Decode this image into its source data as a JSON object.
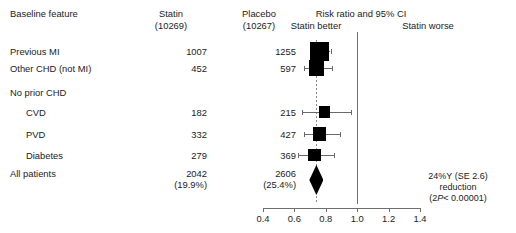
{
  "header": {
    "feature_label": "Baseline feature",
    "statin_label": "Statin",
    "statin_n": "(10269)",
    "placebo_label": "Placebo",
    "placebo_n": "(10267)",
    "plot_title": "Risk ratio and 95% CI",
    "left_side_label": "Statin better",
    "right_side_label": "Statin worse"
  },
  "rows": [
    {
      "feature": "Previous MI",
      "indent": false,
      "statin": "1007",
      "placebo": "1255"
    },
    {
      "feature": "Other CHD (not MI)",
      "indent": false,
      "statin": "452",
      "placebo": "597"
    },
    {
      "feature": "No prior CHD",
      "indent": false,
      "statin": "",
      "placebo": ""
    },
    {
      "feature": "CVD",
      "indent": true,
      "statin": "182",
      "placebo": "215"
    },
    {
      "feature": "PVD",
      "indent": true,
      "statin": "332",
      "placebo": "427"
    },
    {
      "feature": "Diabetes",
      "indent": true,
      "statin": "279",
      "placebo": "369"
    },
    {
      "feature": "All patients",
      "indent": false,
      "statin": "2042",
      "placebo": "2606"
    },
    {
      "feature": "",
      "indent": false,
      "statin": "(19.9%)",
      "placebo": "(25.4%)"
    }
  ],
  "summary_annotation": {
    "line1": "24%Y (SE 2.6)",
    "line2": "reduction",
    "line3_pre": "(2",
    "line3_italic": "P",
    "line3_post": "< 0.00001)"
  },
  "colors": {
    "marker": "#000000",
    "ci_line": "#6a6a6a",
    "null_line": "#6f6f6f",
    "summary_line": "#8a8a8a",
    "text": "#1b1b1b",
    "background": "#ffffff"
  },
  "chart_data": {
    "type": "forest",
    "title": "Risk ratio and 95% CI",
    "xlabel": "",
    "ylabel": "",
    "xlim": [
      0.4,
      1.4
    ],
    "xticks": [
      "0.4",
      "0.6",
      "0.8",
      "1.0",
      "1.2",
      "1.4"
    ],
    "xtick_values": [
      0.4,
      0.6,
      0.8,
      1.0,
      1.2,
      1.4
    ],
    "x_scale": "linear",
    "null_value": 1.0,
    "summary_reference_line": 0.74,
    "grid": false,
    "legend": "none",
    "left_side_label": "Statin better",
    "right_side_label": "Statin worse",
    "points": [
      {
        "label": "Previous MI",
        "rr": 0.76,
        "ci_low": 0.71,
        "ci_high": 0.83,
        "statin_events": 1007,
        "placebo_events": 1255,
        "marker": "square",
        "weight": 1.0
      },
      {
        "label": "Other CHD (not MI)",
        "rr": 0.74,
        "ci_low": 0.66,
        "ci_high": 0.84,
        "statin_events": 452,
        "placebo_events": 597,
        "marker": "square",
        "weight": 0.7
      },
      {
        "label": "CVD",
        "rr": 0.79,
        "ci_low": 0.65,
        "ci_high": 0.96,
        "statin_events": 182,
        "placebo_events": 215,
        "marker": "square",
        "weight": 0.36
      },
      {
        "label": "PVD",
        "rr": 0.76,
        "ci_low": 0.66,
        "ci_high": 0.89,
        "statin_events": 332,
        "placebo_events": 427,
        "marker": "square",
        "weight": 0.55
      },
      {
        "label": "Diabetes",
        "rr": 0.73,
        "ci_low": 0.62,
        "ci_high": 0.85,
        "statin_events": 279,
        "placebo_events": 369,
        "marker": "square",
        "weight": 0.48
      },
      {
        "label": "All patients",
        "rr": 0.74,
        "ci_low": 0.7,
        "ci_high": 0.79,
        "statin_events": 2042,
        "placebo_events": 2606,
        "marker": "diamond",
        "weight": 1.0
      }
    ],
    "totals": {
      "statin_n": 10269,
      "placebo_n": 10267,
      "statin_pct": "19.9%",
      "placebo_pct": "25.4%"
    },
    "annotation": "24%Y (SE 2.6) reduction (2P< 0.00001)"
  }
}
